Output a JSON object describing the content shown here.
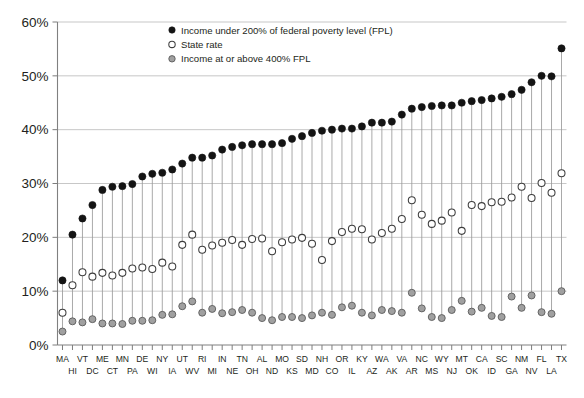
{
  "chart_data": {
    "type": "scatter",
    "title": "",
    "xlabel": "",
    "ylabel": "",
    "ylim": [
      0,
      60
    ],
    "yticks": [
      0,
      10,
      20,
      30,
      40,
      50,
      60
    ],
    "ytick_labels": [
      "0%",
      "10%",
      "20%",
      "30%",
      "40%",
      "50%",
      "60%"
    ],
    "grid": true,
    "legend_position": "top-center",
    "legend": [
      {
        "key": "under200",
        "label": "Income under 200% of federal poverty level (FPL)",
        "marker": "filled-black",
        "color": "#141414"
      },
      {
        "key": "state_rate",
        "label": "State rate",
        "marker": "open-circle",
        "color": "#ffffff"
      },
      {
        "key": "above400",
        "label": "Income at or above 400% FPL",
        "marker": "filled-gray",
        "color": "#a0a0a0"
      }
    ],
    "categories": [
      "MA",
      "HI",
      "VT",
      "DC",
      "ME",
      "CT",
      "MN",
      "PA",
      "DE",
      "WI",
      "NY",
      "IA",
      "UT",
      "WV",
      "RI",
      "MI",
      "IN",
      "NE",
      "TN",
      "OH",
      "AL",
      "ND",
      "MO",
      "KS",
      "SD",
      "MD",
      "NH",
      "CO",
      "OR",
      "IL",
      "KY",
      "AZ",
      "WA",
      "AK",
      "VA",
      "AR",
      "NC",
      "MS",
      "WY",
      "NJ",
      "MT",
      "OK",
      "CA",
      "ID",
      "SC",
      "GA",
      "NM",
      "NV",
      "FL",
      "LA",
      "TX"
    ],
    "series": [
      {
        "name": "Income under 200% of federal poverty level (FPL)",
        "key": "under200",
        "marker": "filled-black",
        "values": [
          12.0,
          20.5,
          23.5,
          26.0,
          28.8,
          29.4,
          29.5,
          29.9,
          31.3,
          31.8,
          32.0,
          32.6,
          33.7,
          34.8,
          34.8,
          35.2,
          36.3,
          36.8,
          37.1,
          37.3,
          37.3,
          37.3,
          37.5,
          38.3,
          38.8,
          39.4,
          39.8,
          40.0,
          40.2,
          40.2,
          40.6,
          41.3,
          41.3,
          41.5,
          42.8,
          43.9,
          44.2,
          44.4,
          44.5,
          44.5,
          45.0,
          45.3,
          45.5,
          45.8,
          46.1,
          46.6,
          47.4,
          48.8,
          50.0,
          49.9,
          55.1
        ]
      },
      {
        "name": "State rate",
        "key": "state_rate",
        "marker": "open-circle",
        "values": [
          6.0,
          11.1,
          13.5,
          12.7,
          13.4,
          12.9,
          13.4,
          14.2,
          14.4,
          14.1,
          15.3,
          14.6,
          18.6,
          20.5,
          17.7,
          18.5,
          19.0,
          19.5,
          18.6,
          19.7,
          19.8,
          17.4,
          19.1,
          19.6,
          19.9,
          18.8,
          15.8,
          19.3,
          21.0,
          21.6,
          21.5,
          19.6,
          20.8,
          21.6,
          23.4,
          26.9,
          24.2,
          22.5,
          23.1,
          24.6,
          21.2,
          26.0,
          25.8,
          26.5,
          26.6,
          27.4,
          29.4,
          27.3,
          30.1,
          28.3,
          31.9
        ]
      },
      {
        "name": "Income at or above 400% FPL",
        "key": "above400",
        "marker": "filled-gray",
        "values": [
          2.5,
          4.4,
          4.2,
          4.8,
          4.0,
          4.0,
          3.9,
          4.5,
          4.5,
          4.6,
          5.6,
          5.7,
          7.2,
          8.1,
          6.0,
          6.7,
          5.9,
          6.1,
          6.5,
          6.0,
          5.0,
          4.6,
          5.2,
          5.2,
          5.0,
          5.5,
          6.0,
          5.6,
          7.0,
          7.3,
          6.0,
          5.5,
          6.5,
          6.3,
          6.0,
          9.7,
          6.8,
          5.2,
          5.0,
          6.5,
          8.2,
          6.2,
          6.9,
          5.4,
          5.2,
          9.0,
          6.9,
          9.2,
          6.1,
          5.8,
          10.0
        ]
      }
    ]
  },
  "legend_items": {
    "under200": "Income under 200% of federal poverty level (FPL)",
    "state_rate": "State rate",
    "above400": "Income at or above 400% FPL"
  }
}
